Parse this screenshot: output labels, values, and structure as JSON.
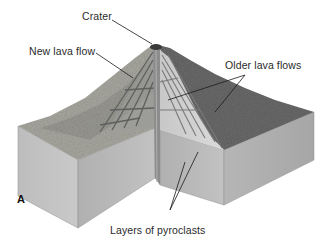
{
  "figure": {
    "panel_label": "A",
    "labels": {
      "crater": "Crater",
      "new_lava_flow": "New lava flow",
      "older_lava_flows": "Older lava flows",
      "pyroclasts": "Layers of pyroclasts"
    },
    "colors": {
      "background": "#ffffff",
      "block_side_light": "#c4c4c4",
      "block_side_dark": "#a9a9a9",
      "surface_light": "#b8b8b0",
      "surface_dark": "#5e5e5e",
      "cutaway_face": "#d0d0d0",
      "layer_lines": "#6a6a6a",
      "conduit": "#8a8a8a",
      "leader_line": "#1a1a1a",
      "label_text": "#2a2a2a"
    }
  }
}
